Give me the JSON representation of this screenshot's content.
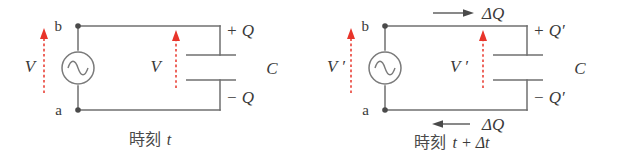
{
  "figure": {
    "background_color": "#ffffff",
    "wire_color": "#6f6f6f",
    "text_color": "#3a3a3a",
    "accent_color": "#e8342a",
    "caption_color": "#4a4a4a"
  },
  "panels": [
    {
      "id": "left-panel",
      "caption": "時刻 t",
      "caption_cjk": "時刻",
      "caption_math": "t",
      "node_top_label": "b",
      "node_bottom_label": "a",
      "source_voltage_label": "V",
      "capacitor_voltage_label": "V",
      "plate_top_charge_label": "+ Q",
      "plate_bottom_charge_label": "− Q",
      "capacitance_label": "C",
      "current_arrows": []
    },
    {
      "id": "right-panel",
      "caption": "時刻 t + Δt",
      "caption_cjk": "時刻",
      "caption_math": "t + Δt",
      "node_top_label": "b",
      "node_bottom_label": "a",
      "source_voltage_label": "V ′",
      "capacitor_voltage_label": "V ′",
      "plate_top_charge_label": "+ Q′",
      "plate_bottom_charge_label": "− Q′",
      "capacitance_label": "C",
      "current_arrows": [
        {
          "id": "top-current-arrow",
          "label": "ΔQ",
          "direction": "right"
        },
        {
          "id": "bottom-current-arrow",
          "label": "ΔQ",
          "direction": "left"
        }
      ]
    }
  ],
  "symbols": {
    "ac_source": "ac-source-icon",
    "capacitor": "capacitor-icon",
    "voltage_arrow": "voltage-arrow-icon",
    "current_arrow": "current-arrow-icon",
    "junction_dot": "junction-dot-icon"
  }
}
